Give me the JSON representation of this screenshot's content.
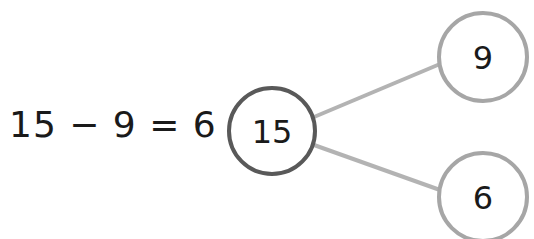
{
  "equation": {
    "text": "15 − 9 = 6"
  },
  "bond": {
    "whole": {
      "label": "15",
      "stroke": "#595959"
    },
    "parts": [
      {
        "label": "9",
        "stroke": "#a6a6a6"
      },
      {
        "label": "6",
        "stroke": "#a6a6a6"
      }
    ],
    "connector_color": "#b3b3b3"
  }
}
